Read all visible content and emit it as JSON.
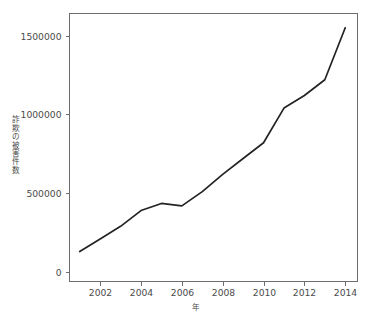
{
  "chart_data": {
    "type": "line",
    "title": "",
    "subtitle": "",
    "xlabel": "年",
    "ylabel": "詐欺の被害件数",
    "x": [
      2001,
      2002,
      2003,
      2004,
      2005,
      2006,
      2007,
      2008,
      2009,
      2010,
      2011,
      2012,
      2013,
      2014
    ],
    "values": [
      130000,
      210000,
      290000,
      390000,
      435000,
      420000,
      510000,
      620000,
      720000,
      820000,
      1040000,
      1120000,
      1220000,
      1550000
    ],
    "series": [
      {
        "name": "詐欺の被害件数",
        "values": [
          130000,
          210000,
          290000,
          390000,
          435000,
          420000,
          510000,
          620000,
          720000,
          820000,
          1040000,
          1120000,
          1220000,
          1550000
        ]
      }
    ],
    "xlim": [
      2000.5,
      2014.6
    ],
    "ylim": [
      -60000,
      1640000
    ],
    "x_tick_labels": [
      "2002",
      "2004",
      "2006",
      "2008",
      "2010",
      "2012",
      "2014"
    ],
    "x_tick_values": [
      2002,
      2004,
      2006,
      2008,
      2010,
      2012,
      2014
    ],
    "y_tick_labels": [
      "0",
      "500000",
      "1000000",
      "1500000"
    ],
    "y_tick_values": [
      0,
      500000,
      1000000,
      1500000
    ],
    "grid": false,
    "legend": false,
    "legend_position": "none",
    "line_color": "#232323",
    "axis_color": "#6e6e6e",
    "background_color": "#ffffff",
    "annotations": []
  },
  "axis": {
    "y_title_chars": [
      "詐",
      "欺",
      "の",
      "被",
      "害",
      "件",
      "数"
    ],
    "x_title": "年"
  }
}
